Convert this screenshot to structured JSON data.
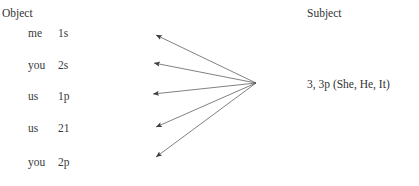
{
  "figure": {
    "type": "diagram",
    "background_color": "#ffffff",
    "line_color": "#4a4a4a",
    "text_color": "#333333"
  },
  "columns": {
    "object_heading": "Object",
    "subject_heading": "Subject"
  },
  "object_items": [
    {
      "person": "me",
      "feature": "1s"
    },
    {
      "person": "you",
      "feature": "2s"
    },
    {
      "person": "us",
      "feature": "1p"
    },
    {
      "person": "us",
      "feature": "21"
    },
    {
      "person": "you",
      "feature": "2p"
    }
  ],
  "subject_items": [
    {
      "label": "3, 3p (She, He, It)"
    }
  ],
  "arrows": {
    "description": "five-arrows-from-subject-to-each-object",
    "origin": {
      "x": 256,
      "y": 83
    },
    "tips": [
      {
        "x": 156,
        "y": 35
      },
      {
        "x": 154,
        "y": 63
      },
      {
        "x": 153,
        "y": 94
      },
      {
        "x": 156,
        "y": 127
      },
      {
        "x": 156,
        "y": 157
      }
    ]
  }
}
